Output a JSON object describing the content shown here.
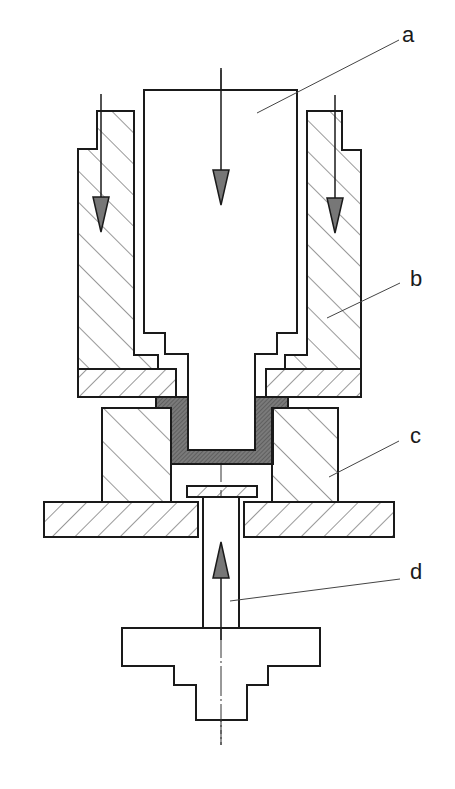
{
  "diagram": {
    "type": "cross-section",
    "labels": [
      {
        "id": "a",
        "text": "a",
        "x": 402,
        "y": 24,
        "target": "punch"
      },
      {
        "id": "b",
        "text": "b",
        "x": 410,
        "y": 268,
        "target": "blank-holder sleeve"
      },
      {
        "id": "c",
        "text": "c",
        "x": 410,
        "y": 425,
        "target": "die"
      },
      {
        "id": "d",
        "text": "d",
        "x": 410,
        "y": 561,
        "target": "ejector"
      }
    ],
    "arrows": [
      {
        "direction": "down",
        "part": "punch",
        "x": 221
      },
      {
        "direction": "down",
        "part": "left sleeve",
        "x": 101
      },
      {
        "direction": "down",
        "part": "right sleeve",
        "x": 335
      },
      {
        "direction": "up",
        "part": "ejector",
        "x": 221
      }
    ],
    "colors": {
      "line": "#1a1a1a",
      "hatch": "#333333",
      "workpiece": "#6e6e6e",
      "arrow_fill": "#777777",
      "background": "#ffffff"
    }
  }
}
